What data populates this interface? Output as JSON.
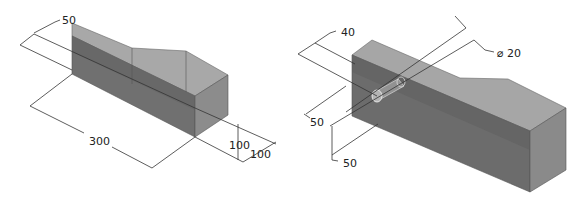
{
  "figures": [
    {
      "id": "left",
      "description": "Isometric block with tapered top",
      "dimensions": {
        "width_top": "50",
        "length": "300",
        "height": "100",
        "depth": "100"
      }
    },
    {
      "id": "right",
      "description": "Isometric block with cylindrical hole",
      "dimensions": {
        "hole_offset": "40",
        "hole_diameter": "⌀ 20",
        "hole_horizontal": "50",
        "hole_vertical": "50"
      }
    }
  ],
  "colors": {
    "top_face": "#a9a9a9",
    "front_face": "#6e6e6e",
    "side_face": "#8a8a8a",
    "dim_line": "#333333",
    "text": "#222222"
  }
}
